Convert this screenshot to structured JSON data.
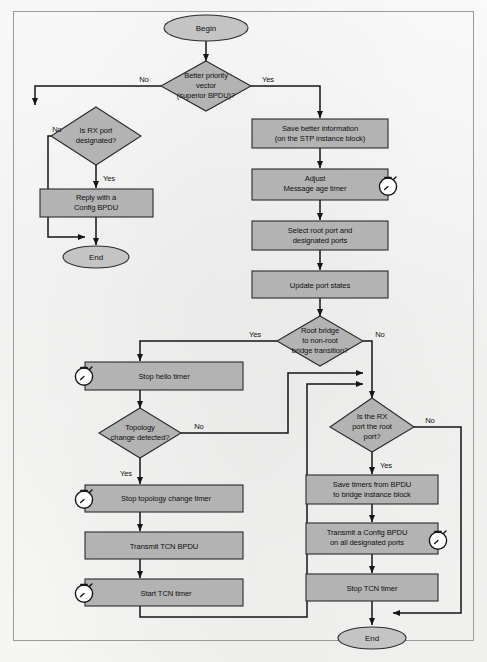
{
  "diagram": {
    "colors": {
      "node_fill": "#b3b3b3",
      "terminator_fill": "#c4c4c4",
      "stroke": "#2b2b2b",
      "line": "#151515",
      "frame": "#9a9a99",
      "page": "#fdfdfc"
    },
    "nodes": {
      "begin": {
        "label": "Begin",
        "type": "terminator"
      },
      "better_priority": {
        "label_line1": "Better priority",
        "label_line2": "vector",
        "label_line3": "(superior BPDU)?",
        "type": "decision"
      },
      "rx_designated": {
        "label_line1": "Is RX port",
        "label_line2": "designated?",
        "type": "decision"
      },
      "reply_config": {
        "label_line1": "Reply with a",
        "label_line2": "Config BPDU",
        "type": "process"
      },
      "end_left": {
        "label": "End",
        "type": "terminator"
      },
      "save_better": {
        "label_line1": "Save better information",
        "label_line2": "(on the STP instance block)",
        "type": "process"
      },
      "adjust_msg_age": {
        "label_line1": "Adjust",
        "label_line2": "Message age timer",
        "type": "process",
        "has_timer": true
      },
      "select_root": {
        "label_line1": "Select root port and",
        "label_line2": "designated ports",
        "type": "process"
      },
      "update_states": {
        "label_line1": "Update port states",
        "type": "process"
      },
      "root_transition": {
        "label_line1": "Root bridge",
        "label_line2": "to non-root",
        "label_line3": "bridge transition?",
        "type": "decision"
      },
      "stop_hello": {
        "label_line1": "Stop hello timer",
        "type": "process",
        "has_timer": true
      },
      "topology_changed": {
        "label_line1": "Topology",
        "label_line2": "change detected?",
        "type": "decision"
      },
      "stop_topology_timer": {
        "label_line1": "Stop topology change timer",
        "type": "process",
        "has_timer": true
      },
      "transmit_tcn": {
        "label_line1": "Transmit TCN BPDU",
        "type": "process"
      },
      "start_tcn": {
        "label_line1": "Start TCN timer",
        "type": "process",
        "has_timer": true
      },
      "rx_is_root": {
        "label_line1": "Is the RX",
        "label_line2": "port the root",
        "label_line3": "port?",
        "type": "decision"
      },
      "save_timers": {
        "label_line1": "Save timers from BPDU",
        "label_line2": "to bridge instance block",
        "type": "process"
      },
      "transmit_config": {
        "label_line1": "Transmit a Config BPDU",
        "label_line2": "on all designated ports",
        "type": "process",
        "has_timer": true
      },
      "stop_tcn": {
        "label_line1": "Stop TCN timer",
        "type": "process"
      },
      "end_right": {
        "label": "End",
        "type": "terminator"
      }
    },
    "edge_labels": {
      "better_no": "No",
      "better_yes": "Yes",
      "rx_designated_no": "No",
      "rx_designated_yes": "Yes",
      "root_transition_yes": "Yes",
      "root_transition_no": "No",
      "topology_no": "No",
      "topology_yes": "Yes",
      "rx_root_no": "No",
      "rx_root_yes": "Yes"
    },
    "icons": {
      "timer": "stopwatch-icon"
    }
  }
}
